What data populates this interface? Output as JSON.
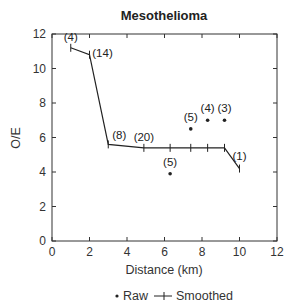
{
  "chart_data": {
    "type": "line",
    "title": "Mesothelioma",
    "xlabel": "Distance (km)",
    "ylabel": "O/E",
    "xlim": [
      0,
      12
    ],
    "ylim": [
      0,
      12
    ],
    "xticks": [
      0,
      2,
      4,
      6,
      8,
      10,
      12
    ],
    "yticks": [
      0,
      2,
      4,
      6,
      8,
      10,
      12
    ],
    "grid": false,
    "legend": {
      "position": "bottom",
      "entries": [
        {
          "label": "Raw",
          "marker": "dot"
        },
        {
          "label": "Smoothed",
          "marker": "line-cross"
        }
      ]
    },
    "series": [
      {
        "name": "Smoothed",
        "style": "line-cross",
        "points": [
          {
            "x": 1.0,
            "y": 11.2,
            "label": "(4)"
          },
          {
            "x": 2.0,
            "y": 10.8,
            "label": "(14)"
          },
          {
            "x": 3.0,
            "y": 5.6,
            "label": "(8)"
          },
          {
            "x": 4.9,
            "y": 5.4,
            "label": "(20)"
          },
          {
            "x": 6.3,
            "y": 5.4,
            "label": ""
          },
          {
            "x": 7.4,
            "y": 5.4,
            "label": ""
          },
          {
            "x": 8.3,
            "y": 5.4,
            "label": ""
          },
          {
            "x": 9.2,
            "y": 5.4,
            "label": ""
          },
          {
            "x": 10.0,
            "y": 4.2,
            "label": "(1)"
          }
        ]
      },
      {
        "name": "Raw",
        "style": "dot",
        "points": [
          {
            "x": 6.3,
            "y": 3.9,
            "label": "(5)"
          },
          {
            "x": 7.4,
            "y": 6.5,
            "label": "(5)"
          },
          {
            "x": 8.3,
            "y": 7.0,
            "label": "(4)"
          },
          {
            "x": 9.2,
            "y": 7.0,
            "label": "(3)"
          }
        ]
      }
    ]
  }
}
